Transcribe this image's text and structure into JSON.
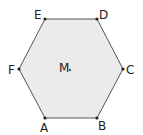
{
  "figure": {
    "type": "hexagon",
    "fill": "#ebebeb",
    "stroke": "#555555",
    "vertices": [
      {
        "label": "A",
        "x": 45,
        "y": 118
      },
      {
        "label": "B",
        "x": 97,
        "y": 118
      },
      {
        "label": "C",
        "x": 123,
        "y": 69
      },
      {
        "label": "D",
        "x": 97,
        "y": 19
      },
      {
        "label": "E",
        "x": 45,
        "y": 19
      },
      {
        "label": "F",
        "x": 19,
        "y": 69
      }
    ],
    "center": {
      "label": "M",
      "x": 70,
      "y": 70
    }
  }
}
